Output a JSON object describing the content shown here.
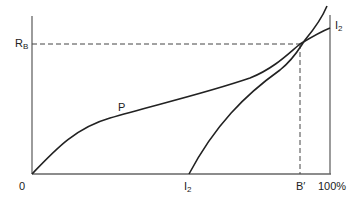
{
  "diagram": {
    "labels": {
      "y_axis_label": "R",
      "y_axis_label_sub": "B",
      "origin": "0",
      "curve_p": "P",
      "curve_i2_top": "I",
      "curve_i2_top_sub": "2",
      "curve_i2_bottom": "I",
      "curve_i2_bottom_sub": "2",
      "x_marker": "B′",
      "x_end": "100%"
    },
    "colors": {
      "axis": "#666666",
      "curve": "#222222",
      "dashed": "#444444"
    }
  }
}
